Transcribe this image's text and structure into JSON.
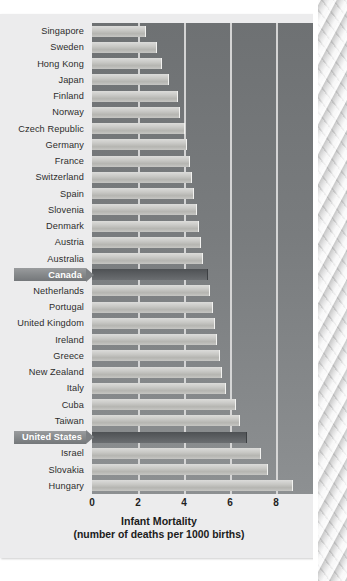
{
  "chart_data": {
    "type": "bar",
    "orientation": "horizontal",
    "title": "Infant Mortality",
    "subtitle": "(number of deaths per 1000 births)",
    "xlabel": "Infant Mortality (number of deaths per 1000 births)",
    "ylabel": "",
    "xlim": [
      0,
      10
    ],
    "xticks": [
      0,
      2,
      4,
      6,
      8,
      10
    ],
    "xtick_labels": [
      "0",
      "2",
      "4",
      "6",
      "8",
      "10"
    ],
    "grid": true,
    "grid_axis": "x",
    "legend": "none",
    "categories": [
      "Singapore",
      "Sweden",
      "Hong Kong",
      "Japan",
      "Finland",
      "Norway",
      "Czech Republic",
      "Germany",
      "France",
      "Switzerland",
      "Spain",
      "Slovenia",
      "Denmark",
      "Austria",
      "Australia",
      "Canada",
      "Netherlands",
      "Portugal",
      "United Kingdom",
      "Ireland",
      "Greece",
      "New Zealand",
      "Italy",
      "Cuba",
      "Taiwan",
      "United States",
      "Israel",
      "Slovakia",
      "Hungary"
    ],
    "values": [
      2.3,
      2.8,
      3.0,
      3.3,
      3.7,
      3.8,
      4.0,
      4.1,
      4.2,
      4.3,
      4.4,
      4.5,
      4.6,
      4.7,
      4.8,
      5.0,
      5.1,
      5.2,
      5.3,
      5.4,
      5.5,
      5.6,
      5.8,
      6.2,
      6.4,
      6.7,
      7.3,
      7.6,
      8.7
    ],
    "highlighted": [
      "Canada",
      "United States"
    ],
    "bar_color": "#c9c9c6",
    "highlight_bar_color": "#5b5e61",
    "plot_background": "#7a7d7f",
    "gridline_color": "#dcdcdc"
  },
  "page": {
    "background": "#ececed",
    "edge_texture": "marbled-page-edge"
  }
}
